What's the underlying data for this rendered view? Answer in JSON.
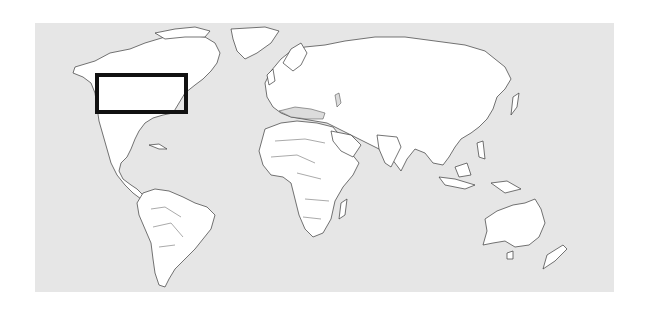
{
  "map": {
    "type": "world-political-outline",
    "projection": "equirectangular-like",
    "colors": {
      "ocean": "#e6e6e6",
      "land": "#ffffff",
      "outline": "#3a3a3a",
      "highlight_border": "#111111",
      "inland_sea": "#dcdcdc"
    },
    "frame": {
      "x": 35,
      "y": 23,
      "width": 579,
      "height": 269
    },
    "highlight": {
      "label": "",
      "region": "northeastern-north-america-great-lakes",
      "x": 95,
      "y": 73,
      "width": 93,
      "height": 41,
      "border_width": 4
    },
    "continents": [
      "north-america",
      "greenland",
      "south-america",
      "europe",
      "africa",
      "asia",
      "australia",
      "new-zealand",
      "madagascar",
      "indonesia"
    ]
  }
}
